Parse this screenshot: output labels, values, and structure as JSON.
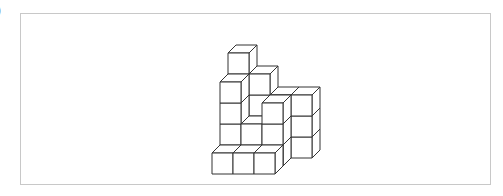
{
  "figure": {
    "label": ")",
    "stroke_color": "#333333",
    "frame_color": "#c8c8c8",
    "cube": {
      "size": 21,
      "depth_dx": 8,
      "depth_dy": -8
    },
    "origin": {
      "x": 212,
      "y": 174
    },
    "cubes": [
      {
        "x": 0,
        "y": 0,
        "z": 0
      },
      {
        "x": 1,
        "y": 0,
        "z": 0
      },
      {
        "x": 2,
        "y": 0,
        "z": 0
      },
      {
        "x": 0,
        "y": 0,
        "z": 1
      },
      {
        "x": 1,
        "y": 0,
        "z": 1
      },
      {
        "x": 2,
        "y": 0,
        "z": 1
      },
      {
        "x": 0,
        "y": 1,
        "z": 1
      },
      {
        "x": 0,
        "y": 2,
        "z": 1
      },
      {
        "x": 0,
        "y": 3,
        "z": 1
      },
      {
        "x": 1,
        "y": 1,
        "z": 1
      },
      {
        "x": 2,
        "y": 1,
        "z": 1
      },
      {
        "x": 2,
        "y": 2,
        "z": 1
      },
      {
        "x": 0,
        "y": 0,
        "z": 2
      },
      {
        "x": 1,
        "y": 0,
        "z": 2
      },
      {
        "x": 2,
        "y": 0,
        "z": 2
      },
      {
        "x": 0,
        "y": 1,
        "z": 2
      },
      {
        "x": 0,
        "y": 2,
        "z": 2
      },
      {
        "x": 0,
        "y": 3,
        "z": 2
      },
      {
        "x": 0,
        "y": 4,
        "z": 2
      },
      {
        "x": 1,
        "y": 1,
        "z": 2
      },
      {
        "x": 1,
        "y": 2,
        "z": 2
      },
      {
        "x": 1,
        "y": 3,
        "z": 2
      },
      {
        "x": 2,
        "y": 1,
        "z": 2
      },
      {
        "x": 2,
        "y": 2,
        "z": 2
      },
      {
        "x": 3,
        "y": 0,
        "z": 2
      },
      {
        "x": 3,
        "y": 1,
        "z": 2
      },
      {
        "x": 3,
        "y": 2,
        "z": 2
      }
    ]
  }
}
